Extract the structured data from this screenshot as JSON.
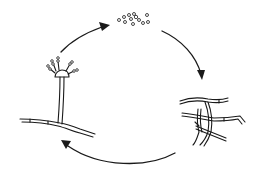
{
  "diagram": {
    "type": "cycle",
    "direction": "clockwise",
    "stages": [
      {
        "id": "spores",
        "name": "Spores (conidia)",
        "icon": "spores-icon",
        "position": "top"
      },
      {
        "id": "mycelium",
        "name": "Branching hyphae / mycelium",
        "icon": "mycelium-icon",
        "position": "right-bottom"
      },
      {
        "id": "conidiophore",
        "name": "Conidiophore with spore head",
        "icon": "conidiophore-icon",
        "position": "left"
      }
    ],
    "arrows": [
      {
        "from": "spores",
        "to": "mycelium",
        "icon": "arrow-icon"
      },
      {
        "from": "mycelium",
        "to": "conidiophore",
        "icon": "arrow-icon"
      },
      {
        "from": "conidiophore",
        "to": "spores",
        "icon": "arrow-icon"
      }
    ],
    "colors": {
      "ink": "#1a1a1a",
      "background": "#ffffff"
    },
    "labels": []
  }
}
